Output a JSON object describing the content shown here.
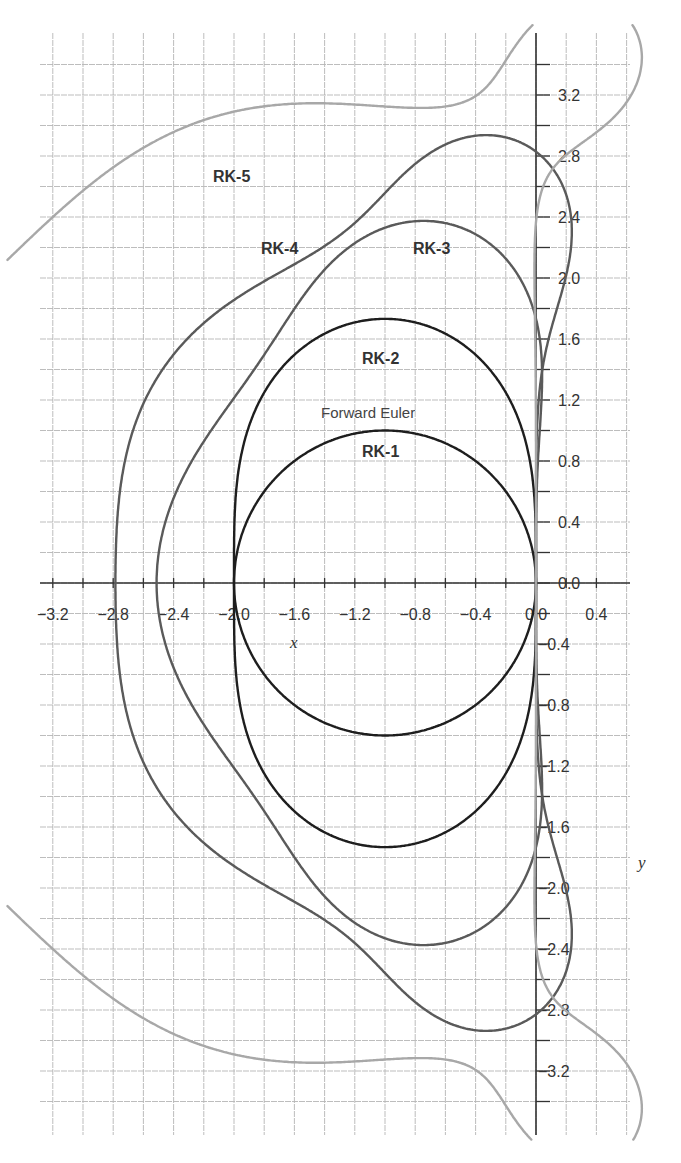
{
  "chart_data": {
    "type": "line",
    "title": "",
    "subtitle": "Stability region boundaries |R(z)| = 1 of explicit Runge-Kutta methods",
    "xlabel": "x",
    "ylabel": "y",
    "xlim": [
      -3.4,
      0.6
    ],
    "ylim": [
      -3.6,
      3.6
    ],
    "grid": true,
    "grid_step": 0.2,
    "x_ticks": [
      -3.2,
      -2.8,
      -2.4,
      -2.0,
      -1.6,
      -1.2,
      -0.8,
      -0.4,
      0.0,
      0.4
    ],
    "x_tick_labels": [
      "−3.2",
      "−2.8",
      "−2.4",
      "−2.0",
      "−1.6",
      "−1.2",
      "−0.8",
      "−0.4",
      "0.0",
      "0.4"
    ],
    "y_ticks": [
      3.2,
      2.8,
      2.4,
      2.0,
      1.6,
      1.2,
      0.8,
      0.4,
      0.0,
      -0.4,
      -0.8,
      -1.2,
      -1.6,
      -2.0,
      -2.4,
      -2.8,
      -3.2
    ],
    "y_tick_labels": [
      "3.2",
      "2.8",
      "2.4",
      "2.0",
      "1.6",
      "1.2",
      "0.8",
      "0.4",
      "0.0",
      "−0.4",
      "−0.8",
      "−1.2",
      "−1.6",
      "−2.0",
      "−2.4",
      "−2.8",
      "−3.2"
    ],
    "legend": "inline labels",
    "series": [
      {
        "name": "RK-1",
        "alt_label": "Forward Euler",
        "color": "#1e1e1e",
        "polynomial": [
          1,
          1
        ],
        "real_axis_intercepts": [
          -2.0,
          0.0
        ],
        "max_imag": 1.0,
        "points": [
          [
            0,
            0
          ],
          [
            -0.293,
            0.707
          ],
          [
            -1,
            1
          ],
          [
            -1.707,
            0.707
          ],
          [
            -2,
            0
          ],
          [
            -1.707,
            -0.707
          ],
          [
            -1,
            -1
          ],
          [
            -0.293,
            -0.707
          ]
        ]
      },
      {
        "name": "RK-2",
        "color": "#1e1e1e",
        "polynomial": [
          1,
          1,
          0.5
        ],
        "real_axis_intercepts": [
          -2.0,
          0.0
        ],
        "max_imag": 1.73,
        "points": [
          [
            0,
            0
          ],
          [
            -0.2,
            1.0
          ],
          [
            -1,
            1.73
          ],
          [
            -1.8,
            1.0
          ],
          [
            -2,
            0
          ],
          [
            -1.8,
            -1.0
          ],
          [
            -1,
            -1.73
          ],
          [
            -0.2,
            -1.0
          ]
        ]
      },
      {
        "name": "RK-3",
        "color": "#5a5a5a",
        "polynomial": [
          1,
          1,
          0.5,
          0.16667
        ],
        "real_axis_intercepts": [
          -2.51,
          0.0
        ],
        "max_imag": 2.37,
        "points": [
          [
            0,
            0
          ],
          [
            0.0,
            1.73
          ],
          [
            -0.75,
            2.37
          ],
          [
            -1.6,
            2.0
          ],
          [
            -2.51,
            0
          ],
          [
            -1.6,
            -2.0
          ],
          [
            -0.75,
            -2.37
          ],
          [
            0.0,
            -1.73
          ]
        ]
      },
      {
        "name": "RK-4",
        "color": "#5a5a5a",
        "polynomial": [
          1,
          1,
          0.5,
          0.16667,
          0.041667
        ],
        "real_axis_intercepts": [
          -2.79,
          0.0
        ],
        "max_imag": 2.94,
        "points": [
          [
            0,
            0
          ],
          [
            0.2,
            2.4
          ],
          [
            -0.35,
            2.94
          ],
          [
            -1.6,
            2.1
          ],
          [
            -2.79,
            0
          ],
          [
            -1.6,
            -2.1
          ],
          [
            -0.35,
            -2.94
          ],
          [
            0.2,
            -2.4
          ]
        ]
      },
      {
        "name": "RK-5",
        "color": "#a8a8a8",
        "polynomial": [
          1,
          1,
          0.5,
          0.16667,
          0.041667,
          0.0083333,
          0.00078125
        ],
        "real_axis_intercepts": [
          -3.22,
          0.0
        ],
        "max_imag": 3.45,
        "points": [
          [
            0,
            0
          ],
          [
            0.0,
            2.1
          ],
          [
            0.57,
            3.0
          ],
          [
            0.2,
            3.45
          ],
          [
            -0.8,
            2.65
          ],
          [
            -2.2,
            2.3
          ],
          [
            -3.22,
            0
          ],
          [
            -2.2,
            -2.3
          ],
          [
            -0.8,
            -2.65
          ],
          [
            0.2,
            -3.45
          ],
          [
            0.57,
            -3.0
          ],
          [
            0.0,
            -2.1
          ]
        ]
      }
    ],
    "annotations": [
      {
        "text": "RK-5",
        "x": -2.05,
        "y": 2.65
      },
      {
        "text": "RK-4",
        "x": -1.65,
        "y": 2.2
      },
      {
        "text": "RK-3",
        "x": -0.6,
        "y": 2.2
      },
      {
        "text": "RK-2",
        "x": -1.0,
        "y": 1.5
      },
      {
        "text": "Forward Euler",
        "x": -1.0,
        "y": 1.12
      },
      {
        "text": "RK-1",
        "x": -1.0,
        "y": 0.85
      }
    ]
  },
  "labels": {
    "rk5": "RK-5",
    "rk4": "RK-4",
    "rk3": "RK-3",
    "rk2": "RK-2",
    "forward_euler": "Forward Euler",
    "rk1": "RK-1",
    "x_axis": "x",
    "y_axis": "y"
  },
  "colors": {
    "grid": "#b5b5b5",
    "axis": "#333333",
    "dark": "#1e1e1e",
    "mid": "#5a5a5a",
    "light": "#a8a8a8"
  }
}
